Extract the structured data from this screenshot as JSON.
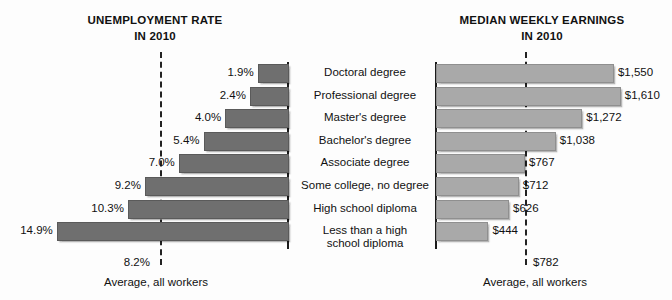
{
  "chart_data": [
    {
      "id": "unemployment",
      "type": "bar",
      "orientation": "horizontal-left",
      "title": "UNEMPLOYMENT RATE",
      "subtitle": "IN 2010",
      "xlabel": "",
      "ylabel": "",
      "unit": "percent",
      "grid": false,
      "legend": null,
      "xlim": [
        0,
        16
      ],
      "categories": [
        "Doctoral degree",
        "Professional degree",
        "Master's degree",
        "Bachelor's degree",
        "Associate degree",
        "Some college, no degree",
        "High school diploma",
        "Less than a high school diploma"
      ],
      "values": [
        1.9,
        2.4,
        4.0,
        5.4,
        7.0,
        9.2,
        10.3,
        14.9
      ],
      "value_labels": [
        "1.9%",
        "2.4%",
        "4.0%",
        "5.4%",
        "7.0%",
        "9.2%",
        "10.3%",
        "14.9%"
      ],
      "reference_line": {
        "value": 8.2,
        "label": "8.2%",
        "caption": "Average, all workers",
        "style": "dashed"
      },
      "bar_color": "#6f6f6f"
    },
    {
      "id": "earnings",
      "type": "bar",
      "orientation": "horizontal-right",
      "title": "MEDIAN WEEKLY EARNINGS",
      "subtitle": "IN 2010",
      "xlabel": "",
      "ylabel": "",
      "unit": "usd-per-week",
      "grid": false,
      "legend": null,
      "xlim": [
        0,
        1800
      ],
      "categories": [
        "Doctoral degree",
        "Professional degree",
        "Master's degree",
        "Bachelor's degree",
        "Associate degree",
        "Some college, no degree",
        "High school diploma",
        "Less than a high school diploma"
      ],
      "values": [
        1550,
        1610,
        1272,
        1038,
        767,
        712,
        626,
        444
      ],
      "value_labels": [
        "$1,550",
        "$1,610",
        "$1,272",
        "$1,038",
        "$767",
        "$712",
        "$626",
        "$444"
      ],
      "reference_line": {
        "value": 782,
        "label": "$782",
        "caption": "Average, all workers",
        "style": "dashed"
      },
      "bar_color": "#a9a9a9"
    }
  ],
  "left_chart": {
    "title_line1": "UNEMPLOYMENT RATE",
    "title_line2": "IN 2010",
    "labels": [
      "1.9%",
      "2.4%",
      "4.0%",
      "5.4%",
      "7.0%",
      "9.2%",
      "10.3%",
      "14.9%"
    ],
    "average_value": "8.2%",
    "average_caption": "Average, all workers"
  },
  "right_chart": {
    "title_line1": "MEDIAN WEEKLY EARNINGS",
    "title_line2": "IN 2010",
    "labels": [
      "$1,550",
      "$1,610",
      "$1,272",
      "$1,038",
      "$767",
      "$712",
      "$626",
      "$444"
    ],
    "average_value": "$782",
    "average_caption": "Average, all workers"
  },
  "categories": {
    "rows": [
      {
        "line1": "Doctoral degree",
        "line2": ""
      },
      {
        "line1": "Professional degree",
        "line2": ""
      },
      {
        "line1": "Master's degree",
        "line2": ""
      },
      {
        "line1": "Bachelor's degree",
        "line2": ""
      },
      {
        "line1": "Associate degree",
        "line2": ""
      },
      {
        "line1": "Some college, no degree",
        "line2": ""
      },
      {
        "line1": "High school diploma",
        "line2": ""
      },
      {
        "line1": "Less than a high",
        "line2": "school diploma"
      }
    ]
  }
}
